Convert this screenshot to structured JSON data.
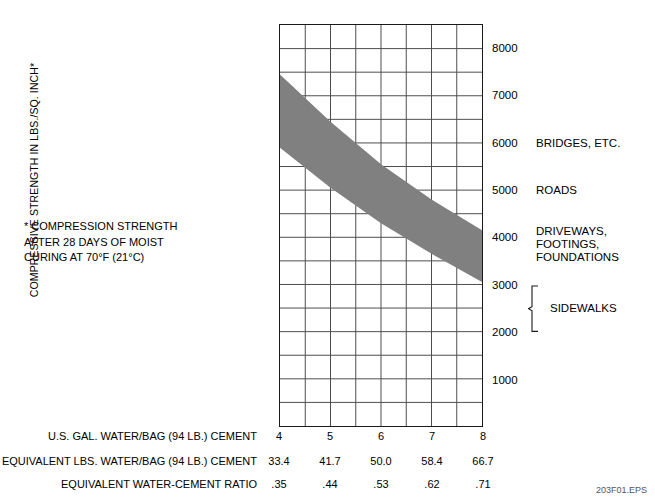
{
  "chart_data": {
    "type": "area",
    "title": "",
    "xlabel": "U.S. GAL. WATER/BAG (94 LB.) CEMENT",
    "ylabel": "COMPRESSIVE STRENGTH IN LBS./SQ. INCH*",
    "xlim": [
      4,
      8
    ],
    "ylim": [
      0,
      8500
    ],
    "grid": true,
    "grid_x_divisions": 8,
    "grid_y_divisions": 17,
    "legend_position": "right-inline-annotations",
    "x_ticks": [
      "4",
      "5",
      "6",
      "7",
      "8"
    ],
    "x_tick_values": [
      4,
      5,
      6,
      7,
      8
    ],
    "y_ticks": [
      "8000",
      "7000",
      "6000",
      "5000",
      "4000",
      "3000",
      "2000",
      "1000"
    ],
    "y_tick_values": [
      8000,
      7000,
      6000,
      5000,
      4000,
      3000,
      2000,
      1000
    ],
    "series": [
      {
        "name": "Upper bound of compressive strength band",
        "x": [
          4,
          5,
          6,
          7,
          8
        ],
        "values": [
          7450,
          6450,
          5550,
          4800,
          4150
        ]
      },
      {
        "name": "Lower bound of compressive strength band",
        "x": [
          4,
          5,
          6,
          7,
          8
        ],
        "values": [
          5900,
          5050,
          4300,
          3650,
          3050
        ]
      }
    ],
    "band_fill_color": "#808080",
    "annotations": [
      {
        "label": "BRIDGES, ETC.",
        "y_value": 6000
      },
      {
        "label": "ROADS",
        "y_value": 5000
      },
      {
        "label": "DRIVEWAYS, FOOTINGS,\nFOUNDATIONS",
        "y_value": 4000
      },
      {
        "label": "SIDEWALKS",
        "y_from": 3000,
        "y_to": 2000
      }
    ]
  },
  "y_axis": {
    "title": "COMPRESSIVE STRENGTH IN LBS./SQ. INCH*",
    "ticks": [
      {
        "label": "8000",
        "value": 8000
      },
      {
        "label": "7000",
        "value": 7000
      },
      {
        "label": "6000",
        "value": 6000
      },
      {
        "label": "5000",
        "value": 5000
      },
      {
        "label": "4000",
        "value": 4000
      },
      {
        "label": "3000",
        "value": 3000
      },
      {
        "label": "2000",
        "value": 2000
      },
      {
        "label": "1000",
        "value": 1000
      }
    ]
  },
  "annotations": {
    "bridges": "BRIDGES, ETC.",
    "roads": "ROADS",
    "driveways": "DRIVEWAYS, FOOTINGS,\nFOUNDATIONS",
    "sidewalks": "SIDEWALKS"
  },
  "footnote": {
    "text": "* COMPRESSION STRENGTH\n  AFTER 28 DAYS OF MOIST\n  CURING AT 70°F (21°C)"
  },
  "bottom_table": {
    "x_tick_labels": [
      "4",
      "5",
      "6",
      "7",
      "8"
    ],
    "rows": [
      {
        "label": "U.S. GAL. WATER/BAG (94 LB.) CEMENT",
        "values": [
          "4",
          "5",
          "6",
          "7",
          "8"
        ]
      },
      {
        "label": "EQUIVALENT LBS. WATER/BAG (94 LB.) CEMENT",
        "values": [
          "33.4",
          "41.7",
          "50.0",
          "58.4",
          "66.7"
        ]
      },
      {
        "label": "EQUIVALENT WATER-CEMENT RATIO",
        "values": [
          ".35",
          ".44",
          ".53",
          ".62",
          ".71"
        ]
      }
    ]
  },
  "eps_code": "203F01.EPS",
  "colors": {
    "band": "#808080",
    "grid": "#4d4d4d",
    "axis": "#1a1a1a",
    "text": "#000000"
  }
}
